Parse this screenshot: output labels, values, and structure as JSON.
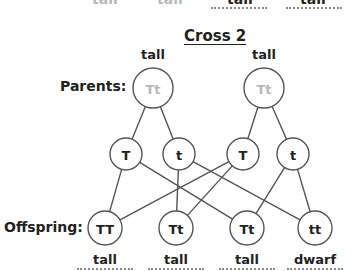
{
  "previous_row": {
    "phenotypes": [
      {
        "label": "tall",
        "x": 105,
        "style": "gray"
      },
      {
        "label": "tall",
        "x": 170,
        "style": "gray"
      },
      {
        "label": "tall",
        "x": 240,
        "style": "dark",
        "dotted": true
      },
      {
        "label": "tall",
        "x": 313,
        "style": "dark",
        "dotted": true
      }
    ]
  },
  "title": "Cross 2",
  "row_labels": {
    "parents": "Parents:",
    "offspring": "Offspring:"
  },
  "parents": [
    {
      "genotype": "Tt",
      "phenotype": "tall",
      "cx": 153,
      "cy": 88,
      "r": 20
    },
    {
      "genotype": "Tt",
      "phenotype": "tall",
      "cx": 264,
      "cy": 88,
      "r": 20
    }
  ],
  "gametes": [
    {
      "allele": "T",
      "cx": 126,
      "cy": 154,
      "r": 16,
      "parent": 0
    },
    {
      "allele": "t",
      "cx": 179,
      "cy": 154,
      "r": 16,
      "parent": 0
    },
    {
      "allele": "T",
      "cx": 243,
      "cy": 154,
      "r": 16,
      "parent": 1
    },
    {
      "allele": "t",
      "cx": 293,
      "cy": 154,
      "r": 16,
      "parent": 1
    }
  ],
  "offspring": [
    {
      "genotype": "TT",
      "phenotype": "tall",
      "cx": 105,
      "cy": 228,
      "r": 17
    },
    {
      "genotype": "Tt",
      "phenotype": "tall",
      "cx": 176,
      "cy": 228,
      "r": 17
    },
    {
      "genotype": "Tt",
      "phenotype": "tall",
      "cx": 247,
      "cy": 228,
      "r": 17
    },
    {
      "genotype": "tt",
      "phenotype": "dwarf",
      "cx": 315,
      "cy": 228,
      "r": 17
    }
  ],
  "connections": [
    {
      "gamete": 0,
      "offspring": 0
    },
    {
      "gamete": 0,
      "offspring": 2
    },
    {
      "gamete": 1,
      "offspring": 1
    },
    {
      "gamete": 1,
      "offspring": 3
    },
    {
      "gamete": 2,
      "offspring": 0
    },
    {
      "gamete": 2,
      "offspring": 1
    },
    {
      "gamete": 3,
      "offspring": 2
    },
    {
      "gamete": 3,
      "offspring": 3
    }
  ],
  "colors": {
    "line": "#555555",
    "parent_text": "#b8b8b8",
    "text": "#222222",
    "dotted": "#888888"
  }
}
